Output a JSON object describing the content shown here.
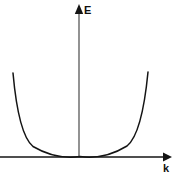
{
  "figure": {
    "background_color": "#ffffff",
    "line_color": "#141414",
    "width": 178,
    "height": 175
  },
  "axes": {
    "vertical": {
      "label": "E",
      "label_x": 84,
      "label_y": 14,
      "x": 79,
      "y_top": 6,
      "y_bottom": 157,
      "arrow": "up",
      "arrow_name": "axis-arrow-up"
    },
    "horizontal": {
      "label": "k",
      "label_x": 166,
      "label_y": 172,
      "y": 157,
      "x_left": 0,
      "x_right": 163,
      "arrow": "right",
      "arrow_name": "axis-arrow-right"
    }
  },
  "chart_data": {
    "type": "line",
    "xlabel": "k",
    "ylabel": "E",
    "grid": false,
    "legend": null,
    "annotations": [],
    "xlim": [
      -1.0,
      1.0
    ],
    "ylim": [
      0,
      1.0
    ],
    "series": [
      {
        "name": "E(k) = A k^2",
        "x": [
          -1.0,
          -0.9,
          -0.8,
          -0.7,
          -0.6,
          -0.5,
          -0.4,
          -0.3,
          -0.2,
          -0.1,
          0.0,
          0.1,
          0.2,
          0.3,
          0.4,
          0.5,
          0.6,
          0.7,
          0.8,
          0.9,
          1.0
        ],
        "y": [
          1.0,
          0.81,
          0.64,
          0.49,
          0.36,
          0.25,
          0.16,
          0.09,
          0.04,
          0.01,
          0.0,
          0.01,
          0.04,
          0.09,
          0.16,
          0.25,
          0.36,
          0.49,
          0.64,
          0.81,
          1.0
        ]
      }
    ],
    "curve_path": "M 13 73 Q 18.5 134.5 33 146.5 Q 56 160 80 156.6 Q 104 160 127 146 Q 142 134 148 72",
    "vertex_pixel": [
      80,
      156.6
    ],
    "left_end_pixel": [
      13,
      73
    ],
    "right_end_pixel": [
      148,
      72
    ]
  }
}
